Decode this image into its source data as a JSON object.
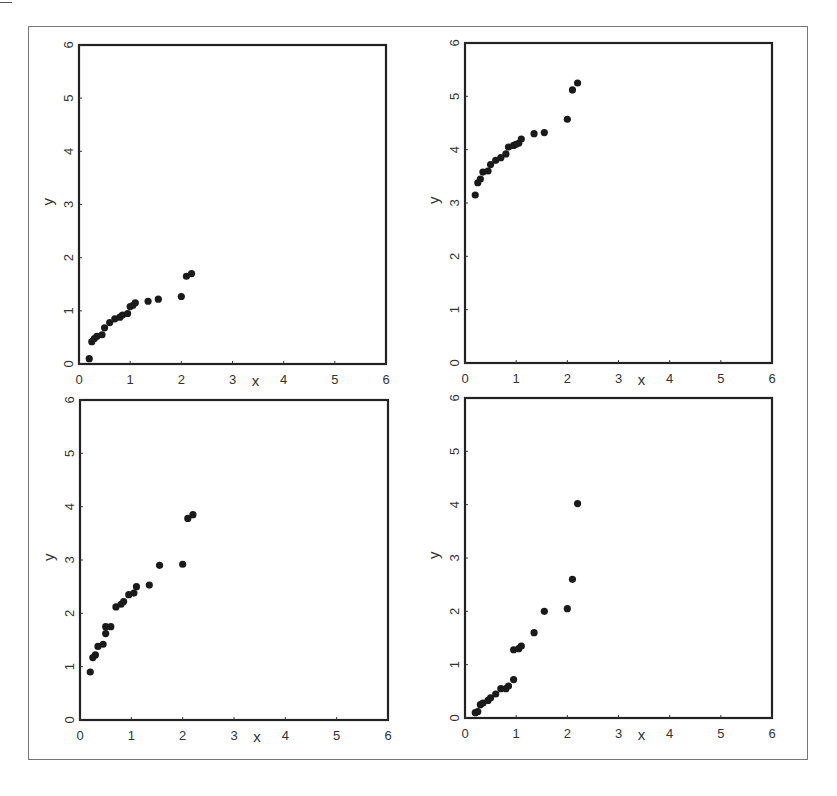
{
  "figure": {
    "panels": [
      {
        "id": "top-left",
        "xlabel": "x",
        "ylabel": "y"
      },
      {
        "id": "top-right",
        "xlabel": "x",
        "ylabel": "y"
      },
      {
        "id": "bottom-left",
        "xlabel": "x",
        "ylabel": "y"
      },
      {
        "id": "bottom-right",
        "xlabel": "x",
        "ylabel": "y"
      }
    ]
  },
  "chart_data": [
    {
      "type": "scatter",
      "title": "",
      "position": "top-left",
      "xlabel": "x",
      "ylabel": "y",
      "xlim": [
        0,
        6
      ],
      "ylim": [
        0,
        6
      ],
      "xticks": [
        "0",
        "1",
        "2",
        "3",
        "4",
        "5",
        "6"
      ],
      "yticks": [
        "0",
        "1",
        "2",
        "3",
        "4",
        "5",
        "6"
      ],
      "grid": false,
      "x": [
        0.2,
        0.25,
        0.3,
        0.35,
        0.45,
        0.5,
        0.6,
        0.7,
        0.8,
        0.85,
        0.95,
        1.0,
        1.05,
        1.1,
        1.35,
        1.55,
        2.0,
        2.1,
        2.2
      ],
      "y": [
        0.1,
        0.42,
        0.48,
        0.52,
        0.55,
        0.68,
        0.78,
        0.85,
        0.88,
        0.92,
        0.95,
        1.08,
        1.1,
        1.15,
        1.18,
        1.22,
        1.27,
        1.65,
        1.7
      ]
    },
    {
      "type": "scatter",
      "title": "",
      "position": "top-right",
      "xlabel": "x",
      "ylabel": "y",
      "xlim": [
        0,
        6
      ],
      "ylim": [
        0,
        6
      ],
      "xticks": [
        "0",
        "1",
        "2",
        "3",
        "4",
        "5",
        "6"
      ],
      "yticks": [
        "0",
        "1",
        "2",
        "3",
        "4",
        "5",
        "6"
      ],
      "grid": false,
      "x": [
        0.2,
        0.25,
        0.3,
        0.35,
        0.45,
        0.5,
        0.6,
        0.7,
        0.8,
        0.85,
        0.95,
        1.0,
        1.05,
        1.1,
        1.35,
        1.55,
        2.0,
        2.1,
        2.2
      ],
      "y": [
        3.15,
        3.38,
        3.45,
        3.58,
        3.6,
        3.72,
        3.8,
        3.85,
        3.92,
        4.05,
        4.08,
        4.1,
        4.12,
        4.2,
        4.3,
        4.32,
        4.57,
        5.12,
        5.25
      ]
    },
    {
      "type": "scatter",
      "title": "",
      "position": "bottom-left",
      "xlabel": "x",
      "ylabel": "y",
      "xlim": [
        0,
        6
      ],
      "ylim": [
        0,
        6
      ],
      "xticks": [
        "0",
        "1",
        "2",
        "3",
        "4",
        "5",
        "6"
      ],
      "yticks": [
        "0",
        "1",
        "2",
        "3",
        "4",
        "5",
        "6"
      ],
      "grid": false,
      "x": [
        0.2,
        0.25,
        0.3,
        0.35,
        0.45,
        0.5,
        0.5,
        0.6,
        0.7,
        0.8,
        0.85,
        0.95,
        1.05,
        1.1,
        1.35,
        1.55,
        2.0,
        2.1,
        2.2
      ],
      "y": [
        0.9,
        1.17,
        1.22,
        1.38,
        1.42,
        1.62,
        1.75,
        1.75,
        2.12,
        2.17,
        2.22,
        2.35,
        2.38,
        2.5,
        2.53,
        2.9,
        2.92,
        3.78,
        3.85
      ]
    },
    {
      "type": "scatter",
      "title": "",
      "position": "bottom-right",
      "xlabel": "x",
      "ylabel": "y",
      "xlim": [
        0,
        6
      ],
      "ylim": [
        0,
        6
      ],
      "xticks": [
        "0",
        "1",
        "2",
        "3",
        "4",
        "5",
        "6"
      ],
      "yticks": [
        "0",
        "1",
        "2",
        "3",
        "4",
        "5",
        "6"
      ],
      "grid": false,
      "x": [
        0.2,
        0.25,
        0.3,
        0.35,
        0.45,
        0.5,
        0.6,
        0.7,
        0.8,
        0.85,
        0.95,
        0.95,
        1.05,
        1.1,
        1.35,
        1.55,
        2.0,
        2.1,
        2.2
      ],
      "y": [
        0.1,
        0.12,
        0.25,
        0.28,
        0.33,
        0.38,
        0.45,
        0.55,
        0.55,
        0.6,
        0.72,
        1.28,
        1.3,
        1.35,
        1.6,
        2.0,
        2.05,
        2.6,
        4.02
      ]
    }
  ],
  "style": {
    "point_color": "#1a1a1a",
    "axis_color": "#222222",
    "frame_color": "#777777"
  }
}
